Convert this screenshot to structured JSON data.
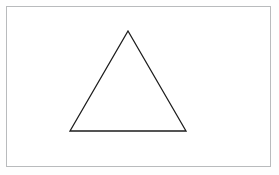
{
  "canvas": {
    "width": 279,
    "height": 175,
    "background_color": "#fefefe",
    "title": "Triangle Figure"
  },
  "frame": {
    "name": "figure-border",
    "x": 6,
    "y": 6,
    "width": 265,
    "height": 161,
    "stroke_color": "#b9bbbd",
    "stroke_width": 1,
    "fill_color": "#ffffff"
  },
  "shapes": [
    {
      "name": "triangle",
      "type": "polygon",
      "sides": 3,
      "label": "Triangle",
      "points": "128,31 186,131 70,131",
      "vertices": [
        {
          "name": "apex",
          "x": 128,
          "y": 31
        },
        {
          "name": "bottom-right",
          "x": 186,
          "y": 131
        },
        {
          "name": "bottom-left",
          "x": 70,
          "y": 131
        }
      ],
      "base_length": 116,
      "height": 100,
      "stroke_color": "#1d1d1d",
      "stroke_width": 1.3,
      "fill_color": "#ffffff"
    }
  ]
}
